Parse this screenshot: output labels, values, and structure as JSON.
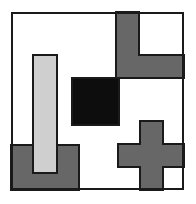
{
  "figure": {
    "canvas": {
      "width": 196,
      "height": 204,
      "background": "#ffffff"
    },
    "palette": {
      "outline": "#1a1a1a",
      "black_fill": "#0d0d0d",
      "dark_gray_fill": "#676767",
      "light_gray_fill": "#cfcfcf",
      "white_fill": "#ffffff"
    },
    "frame": {
      "name": "outer-frame",
      "x": 11,
      "y": 12,
      "width": 173,
      "height": 178,
      "stroke": "#1a1a1a",
      "stroke_width": 2,
      "fill": "#ffffff"
    },
    "shapes": [
      {
        "name": "light-gray-vertical-bar",
        "kind": "rect",
        "fill": "#cfcfcf",
        "x": 33,
        "y": 55,
        "width": 24,
        "height": 118
      },
      {
        "name": "black-square",
        "kind": "rect",
        "fill": "#0d0d0d",
        "x": 72,
        "y": 78,
        "width": 47,
        "height": 47
      },
      {
        "name": "dark-gray-l-shape-top-right",
        "kind": "polygon",
        "fill": "#676767",
        "points": "116,12 139,12 139,55 184,55 184,78 116,78"
      },
      {
        "name": "dark-gray-cross-bottom-right",
        "kind": "polygon",
        "fill": "#676767",
        "points": "140,121 163,121 163,144 184,144 184,167 163,167 163,190 140,190 140,167 118,167 118,144 140,144"
      },
      {
        "name": "dark-gray-rect-bottom-left",
        "kind": "polygon",
        "fill": "#676767",
        "points": "11,145 79,145 79,190 11,190"
      }
    ],
    "z_order_note": "light-gray-vertical-bar is drawn above dark-gray-rect-bottom-left"
  }
}
